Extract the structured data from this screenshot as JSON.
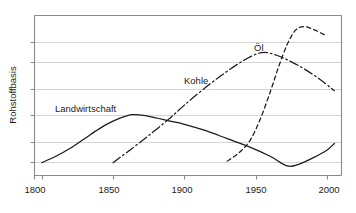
{
  "chart_data": {
    "type": "line",
    "title": "",
    "subtitle": "",
    "xlabel": "",
    "ylabel": "Rohstoffbasis",
    "xlim": [
      1795,
      2010
    ],
    "ylim": [
      0,
      100
    ],
    "x_ticks": [
      1800,
      1850,
      1900,
      1950,
      2000
    ],
    "x_tick_labels": [
      "1800",
      "1850",
      "1900",
      "1950",
      "2000"
    ],
    "y_ticks": [
      8,
      21,
      37,
      53,
      70,
      86
    ],
    "y_tick_labels": [
      "",
      "",
      "",
      "",
      "",
      ""
    ],
    "grid": "horizontal",
    "legend_position": "inline-annotations",
    "axes_visible": [
      "left",
      "bottom",
      "top",
      "right"
    ],
    "series": [
      {
        "name": "Landwirtschaft",
        "style": "solid",
        "color": "#1c1c1c",
        "label_x": 1825,
        "label_y": 45,
        "x": [
          1800,
          1810,
          1820,
          1830,
          1840,
          1850,
          1863,
          1875,
          1890,
          1900,
          1915,
          1930,
          1945,
          1960,
          1972,
          1980,
          1990,
          2000,
          2005
        ],
        "y": [
          8,
          12,
          17,
          23,
          29,
          34,
          38,
          37,
          34,
          32,
          28,
          23,
          18,
          12,
          6,
          7,
          11,
          16,
          20
        ]
      },
      {
        "name": "Kohle",
        "style": "dash-dot",
        "color": "#1c1c1c",
        "label_x": 1912,
        "label_y": 66,
        "x": [
          1850,
          1862,
          1875,
          1890,
          1900,
          1912,
          1925,
          1938,
          1948,
          1956,
          1965,
          1975,
          1985,
          1995,
          2005
        ],
        "y": [
          8,
          16,
          25,
          36,
          44,
          53,
          62,
          70,
          75,
          77,
          75,
          71,
          66,
          60,
          53
        ]
      },
      {
        "name": "Öl",
        "style": "dashed",
        "color": "#1c1c1c",
        "label_x": 1938,
        "label_y": 87,
        "x": [
          1930,
          1938,
          1946,
          1953,
          1960,
          1966,
          1972,
          1978,
          1984,
          1991,
          1998
        ],
        "y": [
          9,
          14,
          22,
          35,
          52,
          68,
          82,
          91,
          93,
          91,
          88
        ]
      }
    ],
    "annotations": [
      {
        "text": "Landwirtschaft",
        "x": 1825,
        "y": 45
      },
      {
        "text": "Kohle",
        "x": 1912,
        "y": 66
      },
      {
        "text": "Öl",
        "x": 1938,
        "y": 87
      }
    ]
  },
  "axis": {
    "y_title": "Rohstoffbasis",
    "x_tick_0": "1800",
    "x_tick_1": "1850",
    "x_tick_2": "1900",
    "x_tick_3": "1950",
    "x_tick_4": "2000"
  },
  "labels": {
    "landwirtschaft": "Landwirtschaft",
    "kohle": "Kohle",
    "oel": "Öl"
  }
}
